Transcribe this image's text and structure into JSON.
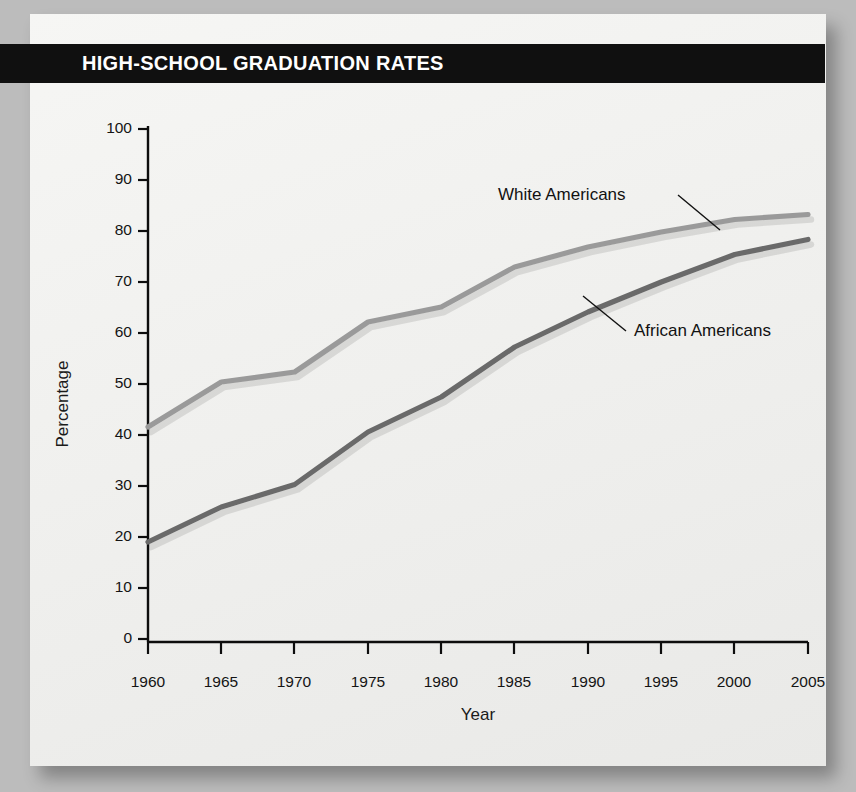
{
  "banner": {
    "title": "HIGH-SCHOOL GRADUATION RATES"
  },
  "colors": {
    "banner_bg": "#101010",
    "banner_text": "#ffffff",
    "card_bg": "#f2f2f0",
    "page_bg": "#bcbcbc",
    "axis": "#0d0d0d",
    "white_americans_line": "#9a9a9a",
    "african_americans_line": "#6a6a6a"
  },
  "chart_data": {
    "type": "line",
    "title": "HIGH-SCHOOL GRADUATION RATES",
    "xlabel": "Year",
    "ylabel": "Percentage",
    "x": [
      1960,
      1965,
      1970,
      1975,
      1980,
      1985,
      1990,
      1995,
      2000,
      2005
    ],
    "xtick_labels": [
      "1960",
      "1965",
      "1970",
      "1975",
      "1980",
      "1985",
      "1990",
      "1995",
      "2000",
      "2005"
    ],
    "xlim": [
      1960,
      2005
    ],
    "ylim": [
      0,
      100
    ],
    "ytick_labels": [
      "0",
      "10",
      "20",
      "30",
      "40",
      "50",
      "60",
      "70",
      "80",
      "90",
      "100"
    ],
    "yticks": [
      0,
      10,
      20,
      30,
      40,
      50,
      60,
      70,
      80,
      90,
      100
    ],
    "grid": false,
    "legend_position": "inline-annotations",
    "series": [
      {
        "name": "White Americans",
        "color": "#9a9a9a",
        "values": [
          43,
          52,
          54,
          64,
          67,
          75,
          79,
          82,
          84.5,
          85.5
        ]
      },
      {
        "name": "African Americans",
        "color": "#6a6a6a",
        "values": [
          20,
          27,
          31.5,
          42,
          49,
          59,
          66,
          72,
          77.5,
          80.5
        ]
      }
    ],
    "annotations": [
      {
        "text": "White Americans",
        "anchor_series": "White Americans",
        "anchor_x": 1993
      },
      {
        "text": "African Americans",
        "anchor_series": "African Americans",
        "anchor_x": 1988
      }
    ]
  }
}
